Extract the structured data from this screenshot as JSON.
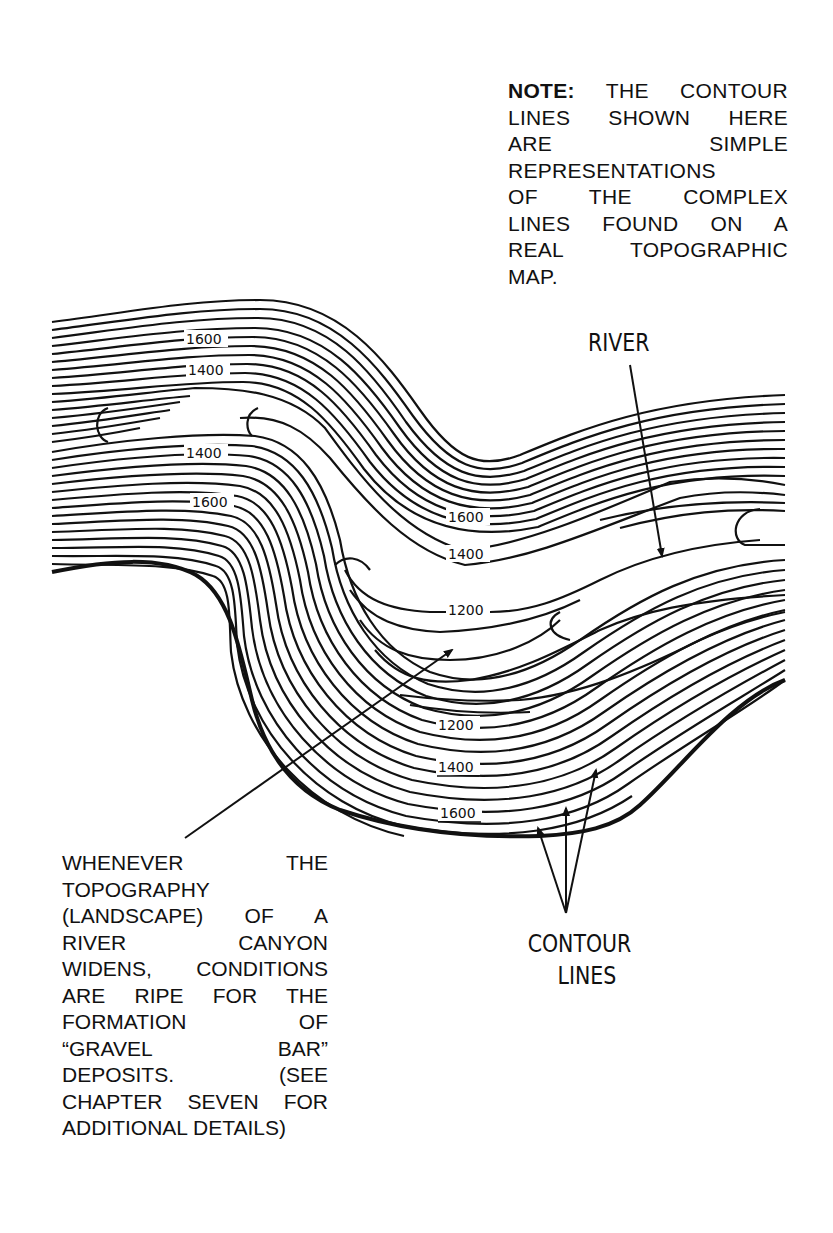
{
  "note": {
    "lead": "NOTE:",
    "lines": [
      " THE CONTOUR",
      "LINES SHOWN HERE",
      "ARE SIMPLE",
      "REPRESENTATIONS",
      "OF THE COMPLEX",
      "LINES FOUND ON A",
      "REAL TOPOGRAPHIC",
      "MAP."
    ]
  },
  "labels": {
    "river": "RIVER",
    "contour_lines_1": "CONTOUR",
    "contour_lines_2": "LINES"
  },
  "elevations": {
    "upper_left_outer": "1600",
    "upper_left_inner": "1400",
    "left_inner": "1400",
    "left_outer": "1600",
    "center_outer": "1600",
    "center_inner": "1400",
    "center_low": "1200",
    "lower_low": "1200",
    "lower_mid": "1400",
    "lower_outer": "1600"
  },
  "caption": {
    "lines": [
      "WHENEVER THE",
      "TOPOGRAPHY",
      "(LANDSCAPE) OF A",
      "RIVER CANYON",
      "WIDENS, CONDITIONS",
      "ARE RIPE FOR THE",
      "FORMATION OF",
      "“GRAVEL BAR”",
      "DEPOSITS. (SEE",
      "CHAPTER SEVEN FOR",
      "ADDITIONAL DETAILS)"
    ]
  },
  "colors": {
    "ink": "#111111",
    "paper": "#ffffff"
  }
}
